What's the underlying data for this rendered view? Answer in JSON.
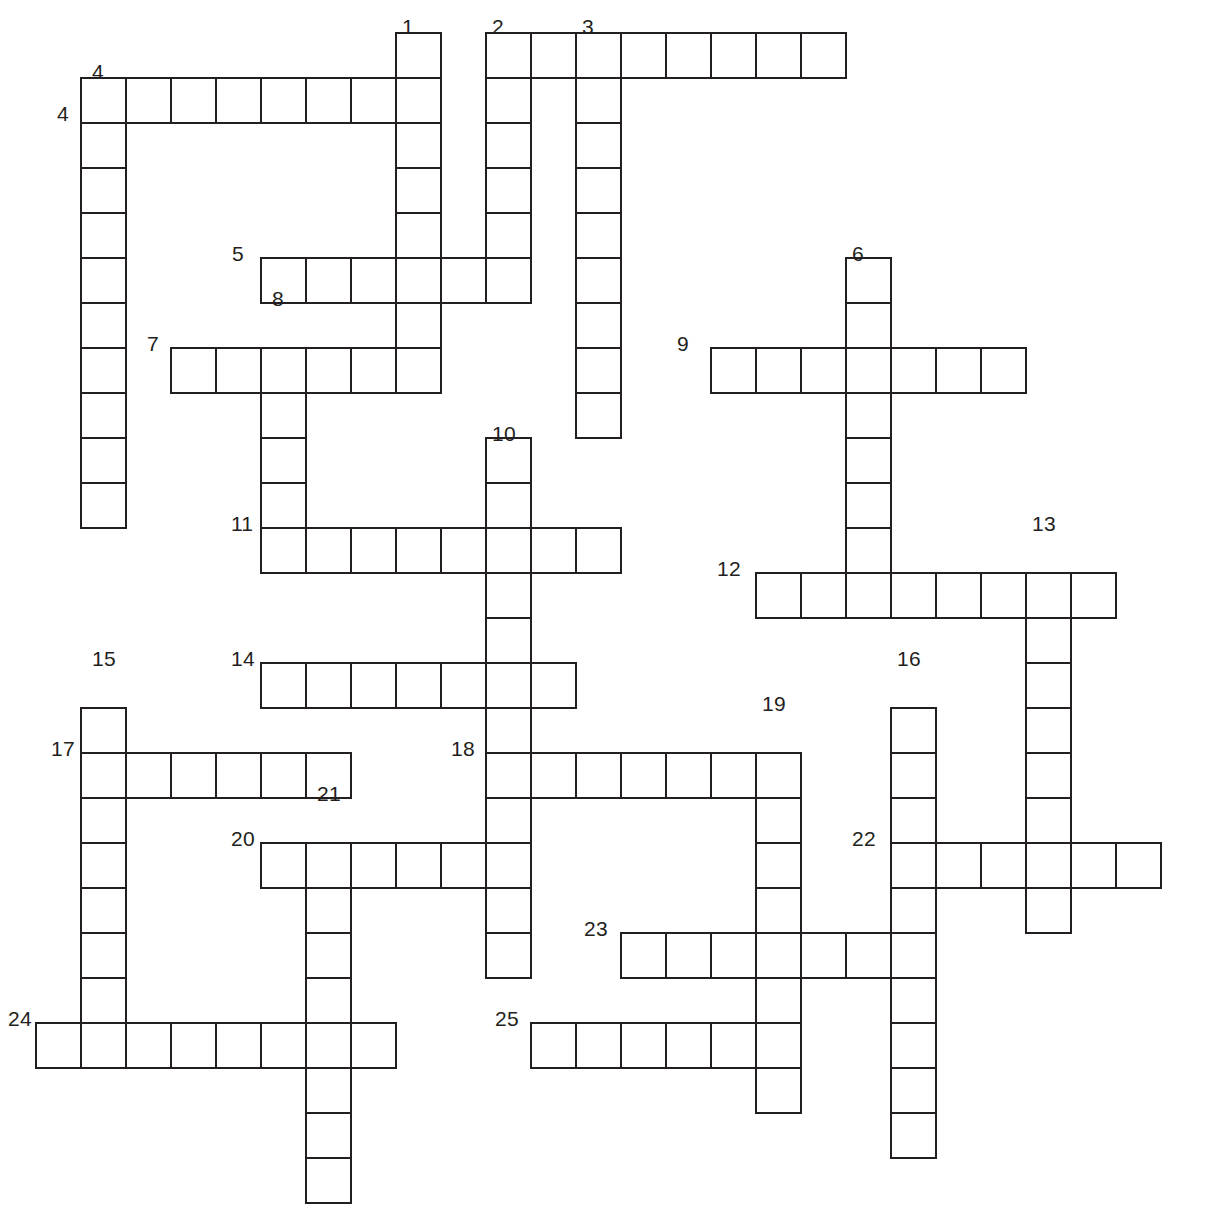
{
  "puzzle": {
    "title": "Crossword Puzzle Grid",
    "cell_size": 45,
    "origin_x": 35,
    "origin_y": 32,
    "line_color": "#231f20",
    "cell_fill": "#ffffff",
    "background": "#ffffff",
    "total_entries": 25,
    "numbers_shown": [
      1,
      2,
      3,
      4,
      4,
      5,
      6,
      7,
      8,
      9,
      10,
      11,
      12,
      13,
      14,
      15,
      16,
      17,
      18,
      19,
      20,
      21,
      22,
      23,
      24,
      25
    ]
  },
  "entries": [
    {
      "number": "1",
      "direction": "down",
      "col": 8,
      "row": 0,
      "length": 8,
      "label_pos": "top"
    },
    {
      "number": "2",
      "direction": "down",
      "col": 10,
      "row": 0,
      "length": 6,
      "label_pos": "top"
    },
    {
      "number": "3",
      "direction": "across",
      "col": 10,
      "row": 0,
      "length": 8,
      "label_pos": "top"
    },
    {
      "number": "3",
      "direction": "down",
      "col": 12,
      "row": 0,
      "length": 9,
      "label_pos": "top"
    },
    {
      "number": "4",
      "direction": "down",
      "col": 1,
      "row": 1,
      "length": 10,
      "label_pos": "top"
    },
    {
      "number": "4",
      "direction": "across",
      "col": 1,
      "row": 1,
      "length": 8,
      "label_pos": "left"
    },
    {
      "number": "5",
      "direction": "across",
      "col": 5,
      "row": 5,
      "length": 6,
      "label_pos": "left"
    },
    {
      "number": "6",
      "direction": "down",
      "col": 18,
      "row": 5,
      "length": 8,
      "label_pos": "top"
    },
    {
      "number": "7",
      "direction": "across",
      "col": 3,
      "row": 7,
      "length": 6,
      "label_pos": "left"
    },
    {
      "number": "8",
      "direction": "down",
      "col": 5,
      "row": 7,
      "length": 5,
      "label_pos": "top"
    },
    {
      "number": "9",
      "direction": "across",
      "col": 15,
      "row": 7,
      "length": 7,
      "label_pos": "left"
    },
    {
      "number": "10",
      "direction": "down",
      "col": 10,
      "row": 9,
      "length": 12,
      "label_pos": "top"
    },
    {
      "number": "11",
      "direction": "across",
      "col": 5,
      "row": 11,
      "length": 8,
      "label_pos": "left"
    },
    {
      "number": "12",
      "direction": "across",
      "col": 16,
      "row": 12,
      "length": 8,
      "label_pos": "left"
    },
    {
      "number": "13",
      "direction": "down",
      "col": 22,
      "row": 12,
      "length": 8,
      "label_pos": "top"
    },
    {
      "number": "14",
      "direction": "across",
      "col": 5,
      "row": 14,
      "length": 7,
      "label_pos": "left"
    },
    {
      "number": "15",
      "direction": "down",
      "col": 1,
      "row": 15,
      "length": 8,
      "label_pos": "top"
    },
    {
      "number": "16",
      "direction": "down",
      "col": 19,
      "row": 15,
      "length": 11,
      "label_pos": "top"
    },
    {
      "number": "17",
      "direction": "across",
      "col": 1,
      "row": 16,
      "length": 6,
      "label_pos": "left"
    },
    {
      "number": "18",
      "direction": "across",
      "col": 10,
      "row": 16,
      "length": 7,
      "label_pos": "left"
    },
    {
      "number": "19",
      "direction": "down",
      "col": 16,
      "row": 16,
      "length": 9,
      "label_pos": "top"
    },
    {
      "number": "20",
      "direction": "across",
      "col": 5,
      "row": 18,
      "length": 6,
      "label_pos": "left"
    },
    {
      "number": "21",
      "direction": "down",
      "col": 6,
      "row": 18,
      "length": 9,
      "label_pos": "top"
    },
    {
      "number": "22",
      "direction": "across",
      "col": 19,
      "row": 18,
      "length": 7,
      "label_pos": "left"
    },
    {
      "number": "23",
      "direction": "across",
      "col": 13,
      "row": 20,
      "length": 6,
      "label_pos": "left"
    },
    {
      "number": "24",
      "direction": "across",
      "col": 0,
      "row": 22,
      "length": 8,
      "label_pos": "left"
    },
    {
      "number": "25",
      "direction": "across",
      "col": 11,
      "row": 22,
      "length": 6,
      "label_pos": "left"
    }
  ],
  "cells": [
    [
      8,
      0
    ],
    [
      10,
      0
    ],
    [
      11,
      0
    ],
    [
      12,
      0
    ],
    [
      13,
      0
    ],
    [
      14,
      0
    ],
    [
      15,
      0
    ],
    [
      16,
      0
    ],
    [
      17,
      0
    ],
    [
      1,
      1
    ],
    [
      2,
      1
    ],
    [
      3,
      1
    ],
    [
      4,
      1
    ],
    [
      5,
      1
    ],
    [
      6,
      1
    ],
    [
      7,
      1
    ],
    [
      8,
      1
    ],
    [
      10,
      1
    ],
    [
      12,
      1
    ],
    [
      1,
      2
    ],
    [
      8,
      2
    ],
    [
      10,
      2
    ],
    [
      12,
      2
    ],
    [
      1,
      3
    ],
    [
      8,
      3
    ],
    [
      10,
      3
    ],
    [
      12,
      3
    ],
    [
      1,
      4
    ],
    [
      8,
      4
    ],
    [
      10,
      4
    ],
    [
      12,
      4
    ],
    [
      1,
      5
    ],
    [
      5,
      5
    ],
    [
      6,
      5
    ],
    [
      7,
      5
    ],
    [
      8,
      5
    ],
    [
      9,
      5
    ],
    [
      10,
      5
    ],
    [
      12,
      5
    ],
    [
      18,
      5
    ],
    [
      1,
      6
    ],
    [
      8,
      6
    ],
    [
      12,
      6
    ],
    [
      18,
      6
    ],
    [
      1,
      7
    ],
    [
      3,
      7
    ],
    [
      4,
      7
    ],
    [
      5,
      7
    ],
    [
      6,
      7
    ],
    [
      7,
      7
    ],
    [
      8,
      7
    ],
    [
      12,
      7
    ],
    [
      15,
      7
    ],
    [
      16,
      7
    ],
    [
      17,
      7
    ],
    [
      18,
      7
    ],
    [
      19,
      7
    ],
    [
      20,
      7
    ],
    [
      21,
      7
    ],
    [
      1,
      8
    ],
    [
      5,
      8
    ],
    [
      12,
      8
    ],
    [
      18,
      8
    ],
    [
      1,
      9
    ],
    [
      5,
      9
    ],
    [
      10,
      9
    ],
    [
      18,
      9
    ],
    [
      1,
      10
    ],
    [
      5,
      10
    ],
    [
      10,
      10
    ],
    [
      18,
      10
    ],
    [
      5,
      11
    ],
    [
      6,
      11
    ],
    [
      7,
      11
    ],
    [
      8,
      11
    ],
    [
      9,
      11
    ],
    [
      10,
      11
    ],
    [
      11,
      11
    ],
    [
      12,
      11
    ],
    [
      18,
      11
    ],
    [
      10,
      12
    ],
    [
      16,
      12
    ],
    [
      17,
      12
    ],
    [
      18,
      12
    ],
    [
      19,
      12
    ],
    [
      20,
      12
    ],
    [
      21,
      12
    ],
    [
      22,
      12
    ],
    [
      23,
      12
    ],
    [
      10,
      13
    ],
    [
      22,
      13
    ],
    [
      5,
      14
    ],
    [
      6,
      14
    ],
    [
      7,
      14
    ],
    [
      8,
      14
    ],
    [
      9,
      14
    ],
    [
      10,
      14
    ],
    [
      11,
      14
    ],
    [
      22,
      14
    ],
    [
      1,
      15
    ],
    [
      10,
      15
    ],
    [
      19,
      15
    ],
    [
      22,
      15
    ],
    [
      1,
      16
    ],
    [
      2,
      16
    ],
    [
      3,
      16
    ],
    [
      4,
      16
    ],
    [
      5,
      16
    ],
    [
      6,
      16
    ],
    [
      10,
      16
    ],
    [
      11,
      16
    ],
    [
      12,
      16
    ],
    [
      13,
      16
    ],
    [
      14,
      16
    ],
    [
      15,
      16
    ],
    [
      16,
      16
    ],
    [
      19,
      16
    ],
    [
      22,
      16
    ],
    [
      1,
      17
    ],
    [
      10,
      17
    ],
    [
      16,
      17
    ],
    [
      19,
      17
    ],
    [
      22,
      17
    ],
    [
      1,
      18
    ],
    [
      5,
      18
    ],
    [
      6,
      18
    ],
    [
      7,
      18
    ],
    [
      8,
      18
    ],
    [
      9,
      18
    ],
    [
      10,
      18
    ],
    [
      16,
      18
    ],
    [
      19,
      18
    ],
    [
      20,
      18
    ],
    [
      21,
      18
    ],
    [
      22,
      18
    ],
    [
      23,
      18
    ],
    [
      24,
      18
    ],
    [
      1,
      19
    ],
    [
      6,
      19
    ],
    [
      10,
      19
    ],
    [
      16,
      19
    ],
    [
      19,
      19
    ],
    [
      22,
      19
    ],
    [
      1,
      20
    ],
    [
      6,
      20
    ],
    [
      10,
      20
    ],
    [
      13,
      20
    ],
    [
      14,
      20
    ],
    [
      15,
      20
    ],
    [
      16,
      20
    ],
    [
      17,
      20
    ],
    [
      18,
      20
    ],
    [
      19,
      20
    ],
    [
      1,
      21
    ],
    [
      6,
      21
    ],
    [
      16,
      21
    ],
    [
      19,
      21
    ],
    [
      0,
      22
    ],
    [
      1,
      22
    ],
    [
      2,
      22
    ],
    [
      3,
      22
    ],
    [
      4,
      22
    ],
    [
      5,
      22
    ],
    [
      6,
      22
    ],
    [
      7,
      22
    ],
    [
      11,
      22
    ],
    [
      12,
      22
    ],
    [
      13,
      22
    ],
    [
      14,
      22
    ],
    [
      15,
      22
    ],
    [
      16,
      22
    ],
    [
      19,
      22
    ],
    [
      6,
      23
    ],
    [
      16,
      23
    ],
    [
      19,
      23
    ],
    [
      6,
      24
    ],
    [
      19,
      24
    ],
    [
      6,
      25
    ]
  ],
  "labels": [
    {
      "text": "1",
      "x": 402,
      "y": 16,
      "anchor": "top"
    },
    {
      "text": "2",
      "x": 492,
      "y": 16,
      "anchor": "top"
    },
    {
      "text": "3",
      "x": 582,
      "y": 16,
      "anchor": "top"
    },
    {
      "text": "4",
      "x": 92,
      "y": 61,
      "anchor": "top"
    },
    {
      "text": "4",
      "x": 57,
      "y": 103,
      "anchor": "left"
    },
    {
      "text": "5",
      "x": 232,
      "y": 243,
      "anchor": "left"
    },
    {
      "text": "6",
      "x": 852,
      "y": 243,
      "anchor": "top"
    },
    {
      "text": "7",
      "x": 147,
      "y": 333,
      "anchor": "left"
    },
    {
      "text": "8",
      "x": 272,
      "y": 288,
      "anchor": "top"
    },
    {
      "text": "9",
      "x": 677,
      "y": 333,
      "anchor": "left"
    },
    {
      "text": "10",
      "x": 492,
      "y": 423,
      "anchor": "top"
    },
    {
      "text": "11",
      "x": 231,
      "y": 513,
      "anchor": "left"
    },
    {
      "text": "12",
      "x": 717,
      "y": 558,
      "anchor": "left"
    },
    {
      "text": "13",
      "x": 1032,
      "y": 513,
      "anchor": "top"
    },
    {
      "text": "14",
      "x": 231,
      "y": 648,
      "anchor": "left"
    },
    {
      "text": "15",
      "x": 92,
      "y": 648,
      "anchor": "top"
    },
    {
      "text": "16",
      "x": 897,
      "y": 648,
      "anchor": "top"
    },
    {
      "text": "17",
      "x": 51,
      "y": 738,
      "anchor": "left"
    },
    {
      "text": "18",
      "x": 451,
      "y": 738,
      "anchor": "left"
    },
    {
      "text": "19",
      "x": 762,
      "y": 693,
      "anchor": "top"
    },
    {
      "text": "20",
      "x": 231,
      "y": 828,
      "anchor": "left"
    },
    {
      "text": "21",
      "x": 317,
      "y": 783,
      "anchor": "top"
    },
    {
      "text": "22",
      "x": 852,
      "y": 828,
      "anchor": "left"
    },
    {
      "text": "23",
      "x": 584,
      "y": 918,
      "anchor": "left"
    },
    {
      "text": "24",
      "x": 8,
      "y": 1008,
      "anchor": "left"
    },
    {
      "text": "25",
      "x": 495,
      "y": 1008,
      "anchor": "left"
    }
  ]
}
